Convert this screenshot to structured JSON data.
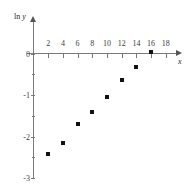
{
  "chart_data": {
    "type": "scatter",
    "title": "",
    "xlabel": "x",
    "ylabel": "ln y",
    "ylabel_prefix": "ln ",
    "ylabel_var": "y",
    "x": [
      2,
      4,
      6,
      8,
      10,
      12,
      14,
      16
    ],
    "values": [
      -2.43,
      -2.15,
      -1.71,
      -1.4,
      -1.05,
      -0.65,
      -0.32,
      0.03
    ],
    "series": [
      {
        "name": "ln y vs x",
        "points": [
          {
            "x": 2,
            "y": -2.43
          },
          {
            "x": 4,
            "y": -2.15
          },
          {
            "x": 6,
            "y": -1.71
          },
          {
            "x": 8,
            "y": -1.4
          },
          {
            "x": 10,
            "y": -1.05
          },
          {
            "x": 12,
            "y": -0.65
          },
          {
            "x": 14,
            "y": -0.32
          },
          {
            "x": 16,
            "y": 0.03
          }
        ]
      }
    ],
    "xlim": [
      0,
      19.5
    ],
    "ylim": [
      -3,
      0.3
    ],
    "xticks": [
      2,
      4,
      6,
      8,
      10,
      12,
      14,
      16,
      18
    ],
    "xtick_labels": [
      "2",
      "4",
      "6",
      "8",
      "10",
      "12",
      "14",
      "16",
      "18"
    ],
    "yticks": [
      0,
      -1,
      -2,
      -3
    ],
    "ytick_labels": [
      "0",
      "-1",
      "-2",
      "-3"
    ],
    "yticks_minor": [
      -0.5,
      -1.5,
      -2.5
    ],
    "grid": false,
    "legend": false,
    "marker": "square",
    "marker_color": "#111111",
    "axis_color": "#7a7a7a"
  }
}
